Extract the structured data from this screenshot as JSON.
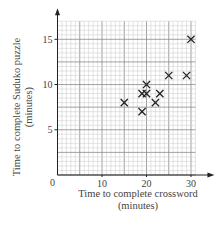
{
  "chart_data": {
    "type": "scatter",
    "title": "",
    "xlabel": "Time to complete crossword",
    "xlabel_unit": "(minutes)",
    "ylabel": "Time to complete Suduko puzzle",
    "ylabel_unit": "(minutes)",
    "xlim": [
      0,
      30
    ],
    "ylim": [
      0,
      15
    ],
    "x_ticks": [
      0,
      10,
      20,
      30
    ],
    "y_ticks": [
      5,
      10,
      15
    ],
    "origin_label": "0",
    "grid": true,
    "marker": "x",
    "points": [
      {
        "x": 15,
        "y": 8
      },
      {
        "x": 19,
        "y": 7
      },
      {
        "x": 19,
        "y": 9
      },
      {
        "x": 20,
        "y": 9
      },
      {
        "x": 20,
        "y": 10
      },
      {
        "x": 22,
        "y": 8
      },
      {
        "x": 23,
        "y": 9
      },
      {
        "x": 25,
        "y": 11
      },
      {
        "x": 29,
        "y": 11
      },
      {
        "x": 30,
        "y": 15
      }
    ]
  },
  "colors": {
    "minor_grid": "#c8c8c8",
    "major_grid": "#8a8a8a",
    "axis": "#222222",
    "marker": "#222222"
  }
}
